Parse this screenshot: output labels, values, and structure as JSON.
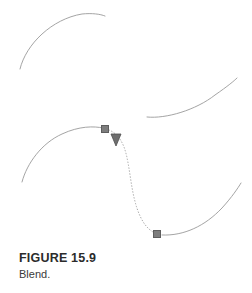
{
  "figure": {
    "caption_label": "FIGURE 15.9",
    "caption_text": "Blend.",
    "colors": {
      "stroke": "#9a9a9a",
      "blend_dotted": "#a8a8a8",
      "handle_fill": "#7d7d7d",
      "handle_stroke": "#5e5e5e",
      "cursor_fill": "#6e6e6e",
      "caption_title": "#2b2b2b",
      "caption_text": "#3a3a3a",
      "background": "#ffffff"
    },
    "elements": {
      "arc_top_left": "top-left concave-down arc",
      "arc_middle_right": "middle-right concave-up arc",
      "arc_bottom_right": "bottom-right concave-up arc",
      "blend_source_curve": "lower-left solid arc ending at first handle",
      "blend_dotted_curve": "dotted S-shaped blend path",
      "handle_start": "square anchor handle at blend start",
      "handle_end": "square anchor handle at blend end",
      "cursor": "downward-pointing triangle pen cursor"
    }
  }
}
